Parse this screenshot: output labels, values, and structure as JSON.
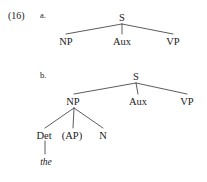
{
  "figure": {
    "example_number": "(16)",
    "background_color": "#ffffff",
    "text_color": "#212121",
    "line_color": "#4a4a4a",
    "items": [
      {
        "letter": "a.",
        "label_x": 40,
        "label_y": 11,
        "tree": {
          "root": {
            "label": "S",
            "x": 122,
            "y": 13
          },
          "children": [
            {
              "label": "NP",
              "x": 66,
              "y": 37
            },
            {
              "label": "Aux",
              "x": 122,
              "y": 37
            },
            {
              "label": "VP",
              "x": 173,
              "y": 37
            }
          ]
        }
      },
      {
        "letter": "b.",
        "label_x": 40,
        "label_y": 71,
        "tree": {
          "root": {
            "label": "S",
            "x": 136,
            "y": 72
          },
          "children": [
            {
              "label": "NP",
              "x": 73,
              "y": 97
            },
            {
              "label": "Aux",
              "x": 138,
              "y": 97
            },
            {
              "label": "VP",
              "x": 187,
              "y": 97
            }
          ],
          "np_children": [
            {
              "label": "Det",
              "x": 44,
              "y": 131
            },
            {
              "label": "(AP)",
              "x": 72,
              "y": 131
            },
            {
              "label": "N",
              "x": 103,
              "y": 131
            }
          ],
          "det_terminal": {
            "label": "the",
            "x": 45,
            "y": 158
          }
        }
      }
    ],
    "edges": [
      {
        "name": "a-s-to-np",
        "x1": 122,
        "y1": 24,
        "x2": 66,
        "y2": 34
      },
      {
        "name": "a-s-to-aux",
        "x1": 122,
        "y1": 24,
        "x2": 122,
        "y2": 34
      },
      {
        "name": "a-s-to-vp",
        "x1": 122,
        "y1": 24,
        "x2": 173,
        "y2": 34
      },
      {
        "name": "b-s-to-np",
        "x1": 136,
        "y1": 83,
        "x2": 74,
        "y2": 94
      },
      {
        "name": "b-s-to-aux",
        "x1": 136,
        "y1": 83,
        "x2": 138,
        "y2": 94
      },
      {
        "name": "b-s-to-vp",
        "x1": 136,
        "y1": 83,
        "x2": 187,
        "y2": 94
      },
      {
        "name": "b-np-to-det",
        "x1": 74,
        "y1": 108,
        "x2": 45,
        "y2": 128
      },
      {
        "name": "b-np-to-ap",
        "x1": 74,
        "y1": 108,
        "x2": 73,
        "y2": 128
      },
      {
        "name": "b-np-to-n",
        "x1": 74,
        "y1": 108,
        "x2": 103,
        "y2": 128
      },
      {
        "name": "b-det-to-the",
        "x1": 45,
        "y1": 141,
        "x2": 45,
        "y2": 154
      }
    ]
  }
}
